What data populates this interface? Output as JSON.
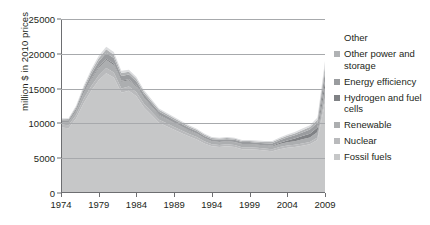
{
  "chart_data": {
    "type": "area",
    "stacked": true,
    "title": "",
    "subtitle": "",
    "xlabel": "",
    "ylabel": "million $ in 2010 prices",
    "xlim": [
      1974,
      2009
    ],
    "ylim": [
      0,
      25000
    ],
    "ytick_values": [
      0,
      5000,
      10000,
      15000,
      20000,
      25000
    ],
    "ytick_labels": [
      "0",
      "5000",
      "10000",
      "15000",
      "20000",
      "25000"
    ],
    "xtick_values": [
      1974,
      1979,
      1984,
      1989,
      1994,
      1999,
      2004,
      2009
    ],
    "xtick_labels": [
      "1974",
      "1979",
      "1984",
      "1989",
      "1994",
      "1999",
      "2004",
      "2009"
    ],
    "grid": "horizontal",
    "legend_position": "right",
    "x": [
      1974,
      1975,
      1976,
      1977,
      1978,
      1979,
      1980,
      1981,
      1982,
      1983,
      1984,
      1985,
      1986,
      1987,
      1988,
      1989,
      1990,
      1991,
      1992,
      1993,
      1994,
      1995,
      1996,
      1997,
      1998,
      1999,
      2000,
      2001,
      2002,
      2003,
      2004,
      2005,
      2006,
      2007,
      2008,
      2009
    ],
    "series": [
      {
        "name": "Fossil fuels",
        "color": "#c6c7c8",
        "values": [
          9400,
          9300,
          10700,
          12900,
          14700,
          16200,
          17200,
          16600,
          14400,
          14700,
          13900,
          12300,
          11200,
          10100,
          9600,
          9100,
          8600,
          8100,
          7700,
          7100,
          6700,
          6600,
          6700,
          6600,
          6300,
          6300,
          6200,
          6100,
          6000,
          6300,
          6500,
          6600,
          6800,
          7000,
          7600,
          13000
        ]
      },
      {
        "name": "Nuclear",
        "color": "#b9babc",
        "values": [
          450,
          450,
          500,
          600,
          650,
          700,
          750,
          700,
          620,
          600,
          560,
          520,
          480,
          440,
          420,
          400,
          380,
          360,
          340,
          320,
          300,
          300,
          300,
          300,
          290,
          290,
          290,
          290,
          290,
          300,
          310,
          320,
          330,
          340,
          380,
          650
        ]
      },
      {
        "name": "Renewable",
        "color": "#acaeb0",
        "values": [
          300,
          350,
          480,
          700,
          900,
          1050,
          1150,
          1100,
          950,
          900,
          820,
          740,
          660,
          600,
          560,
          520,
          490,
          460,
          430,
          400,
          380,
          380,
          380,
          380,
          370,
          370,
          380,
          390,
          400,
          430,
          470,
          520,
          580,
          650,
          800,
          1500
        ]
      },
      {
        "name": "Hydrogen and fuel cells",
        "color": "#808285",
        "values": [
          60,
          70,
          90,
          120,
          150,
          180,
          200,
          190,
          160,
          150,
          140,
          130,
          115,
          100,
          95,
          90,
          85,
          80,
          75,
          70,
          65,
          65,
          65,
          65,
          65,
          65,
          70,
          80,
          110,
          180,
          280,
          380,
          470,
          540,
          620,
          900
        ]
      },
      {
        "name": "Energy efficiency",
        "color": "#9a9c9f",
        "values": [
          250,
          280,
          380,
          520,
          650,
          760,
          830,
          800,
          690,
          660,
          600,
          540,
          480,
          440,
          410,
          390,
          370,
          350,
          330,
          310,
          290,
          290,
          290,
          290,
          285,
          285,
          290,
          300,
          320,
          360,
          410,
          460,
          520,
          580,
          700,
          1400
        ]
      },
      {
        "name": "Other power and storage",
        "color": "#b0b2b4",
        "values": [
          150,
          170,
          230,
          320,
          400,
          470,
          510,
          490,
          420,
          400,
          365,
          330,
          295,
          270,
          250,
          240,
          225,
          215,
          200,
          190,
          180,
          180,
          180,
          180,
          175,
          175,
          180,
          185,
          195,
          220,
          250,
          280,
          315,
          355,
          430,
          850
        ]
      },
      {
        "name": "Other",
        "color": "#dcdddf",
        "values": [
          120,
          130,
          180,
          250,
          310,
          360,
          390,
          375,
          325,
          310,
          280,
          255,
          228,
          207,
          193,
          184,
          173,
          165,
          154,
          146,
          138,
          138,
          138,
          138,
          134,
          134,
          138,
          142,
          150,
          169,
          192,
          215,
          242,
          273,
          330,
          650
        ]
      }
    ],
    "legend_entries": [
      {
        "label": "Other",
        "color": "#dcdddf",
        "swatch": false
      },
      {
        "label": "Other power and storage",
        "color": "#b0b2b4",
        "swatch": true
      },
      {
        "label": "Energy efficiency",
        "color": "#9a9c9f",
        "swatch": true
      },
      {
        "label": "Hydrogen and fuel cells",
        "color": "#808285",
        "swatch": true
      },
      {
        "label": "Renewable",
        "color": "#acaeb0",
        "swatch": true
      },
      {
        "label": "Nuclear",
        "color": "#b9babc",
        "swatch": true
      },
      {
        "label": "Fossil fuels",
        "color": "#c6c7c8",
        "swatch": true
      }
    ]
  }
}
